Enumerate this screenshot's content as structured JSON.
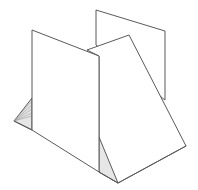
{
  "diagram": {
    "colors": {
      "stroke": "#5a5a5a",
      "shade": "#e6e6e6",
      "hatch": "#9a9a9a",
      "background": "#ffffff"
    },
    "shapes": {
      "back_panel": "96,10 165,31 165,100 96,45",
      "front_panel": "32,30 99,56 99,172 32,130",
      "slanted_panel": "87,50 129,35 186,146 118,183 99,172 99,56",
      "left_triangle": "14,121 32,98 32,130",
      "bottom_triangle": "99,137 99,172 118,183",
      "base_edge_left": "32,130 14,121",
      "base_edge_right": "99,172 118,183 186,146"
    }
  }
}
